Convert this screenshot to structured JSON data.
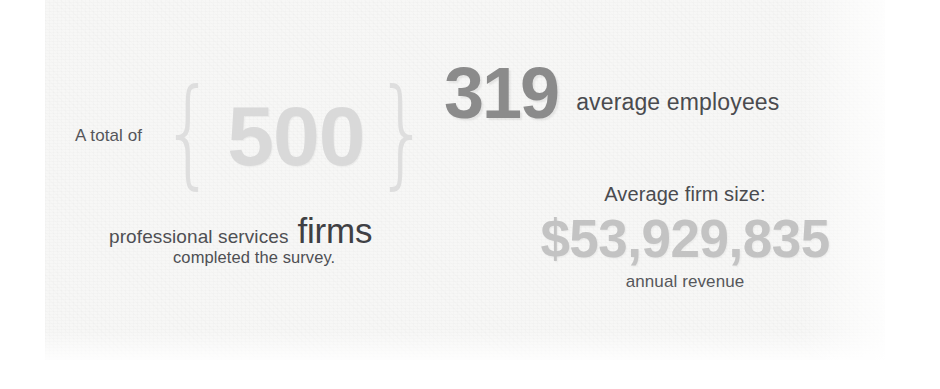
{
  "panel": {
    "background_color": "#f7f7f6",
    "page_background_color": "#ffffff"
  },
  "stats": {
    "firms": {
      "prefix_label": "A total of",
      "open_brace": "{",
      "value": "500",
      "close_brace": "}",
      "value_color": "#d9d9d9",
      "descriptor_small": "professional services",
      "descriptor_large": "firms",
      "caption": "completed the survey."
    },
    "employees": {
      "value": "319",
      "value_color": "#8b8b8b",
      "label": "average employees"
    },
    "revenue": {
      "heading": "Average firm size:",
      "value": "$53,929,835",
      "value_color": "#c3c3c3",
      "caption": "annual revenue"
    }
  },
  "chart_data": {
    "type": "table",
    "categories": [
      "Firms surveyed",
      "Average employees",
      "Average annual revenue"
    ],
    "values": [
      500,
      319,
      53929835
    ],
    "value_labels": [
      "500",
      "319",
      "$53,929,835"
    ],
    "annotations": [
      "A total of 500 professional services firms completed the survey.",
      "319 average employees",
      "Average firm size: $53,929,835 annual revenue"
    ],
    "xlabel": "",
    "ylabel": "",
    "legend": []
  }
}
